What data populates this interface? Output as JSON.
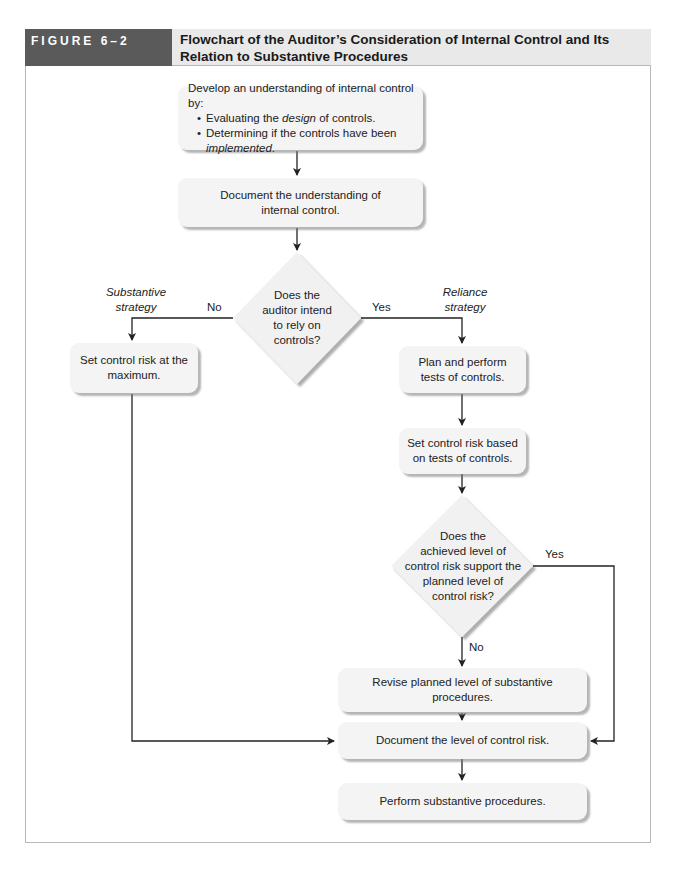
{
  "figure": {
    "label": "FIGURE 6–2",
    "title_line1": "Flowchart of the Auditor’s Consideration of Internal Control and Its",
    "title_line2": "Relation to Substantive Procedures"
  },
  "nodes": {
    "develop": {
      "intro": "Develop an understanding of internal control by:",
      "bullet1_pre": "Evaluating the ",
      "bullet1_em": "design",
      "bullet1_post": " of controls.",
      "bullet2": "Determining if the controls have been",
      "bullet2_em": "implemented",
      "bullet2_post": "."
    },
    "document_understanding": {
      "line1": "Document the understanding of",
      "line2": "internal control."
    },
    "decision_rely": {
      "line1": "Does the",
      "line2": "auditor intend",
      "line3": "to rely on",
      "line4": "controls?"
    },
    "set_max": {
      "line1": "Set control risk at the",
      "line2": "maximum."
    },
    "plan_perform": {
      "line1": "Plan and perform",
      "line2": "tests of controls."
    },
    "set_based": {
      "line1": "Set control risk based",
      "line2": "on tests of controls."
    },
    "decision_support": {
      "line1": "Does the",
      "line2": "achieved level of",
      "line3": "control risk support the",
      "line4": "planned level of",
      "line5": "control risk?"
    },
    "revise": {
      "text": "Revise planned level of substantive procedures."
    },
    "document_level": {
      "text": "Document the level of control risk."
    },
    "perform_substantive": {
      "text": "Perform substantive procedures."
    }
  },
  "edge_labels": {
    "no_left": "No",
    "yes_right": "Yes",
    "substantive_strategy_1": "Substantive",
    "substantive_strategy_2": "strategy",
    "reliance_strategy_1": "Reliance",
    "reliance_strategy_2": "strategy",
    "yes_support": "Yes",
    "no_support": "No"
  },
  "colors": {
    "label_bg": "#5a5a5a",
    "title_bg": "#e9e9e9",
    "box_fill": "#f4f4f4",
    "line": "#222222"
  }
}
